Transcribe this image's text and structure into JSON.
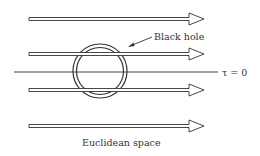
{
  "diagram": {
    "labels": {
      "black_hole": "Black hole",
      "tau": "τ = 0",
      "space": "Euclidean space"
    },
    "arrows": [
      {
        "name": "arrow-1",
        "y": 19
      },
      {
        "name": "arrow-2",
        "y": 54
      },
      {
        "name": "arrow-3",
        "y": 90
      },
      {
        "name": "arrow-4",
        "y": 126
      }
    ],
    "colors": {
      "stroke": "#333333",
      "background": "#ffffff"
    }
  }
}
